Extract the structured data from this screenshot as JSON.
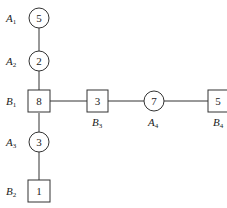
{
  "diagram": {
    "nodes": [
      {
        "id": "A1",
        "shape": "circle",
        "value": "5",
        "label": "A",
        "sub": "1"
      },
      {
        "id": "A2",
        "shape": "circle",
        "value": "2",
        "label": "A",
        "sub": "2"
      },
      {
        "id": "B1",
        "shape": "square",
        "value": "8",
        "label": "B",
        "sub": "1"
      },
      {
        "id": "A3",
        "shape": "circle",
        "value": "3",
        "label": "A",
        "sub": "3"
      },
      {
        "id": "B2",
        "shape": "square",
        "value": "1",
        "label": "B",
        "sub": "2"
      },
      {
        "id": "B3",
        "shape": "square",
        "value": "3",
        "label": "B",
        "sub": "3"
      },
      {
        "id": "A4",
        "shape": "circle",
        "value": "7",
        "label": "A",
        "sub": "4"
      },
      {
        "id": "B4",
        "shape": "square",
        "value": "5",
        "label": "B",
        "sub": "4"
      }
    ],
    "edges": [
      [
        "A1",
        "A2"
      ],
      [
        "A2",
        "B1"
      ],
      [
        "B1",
        "A3"
      ],
      [
        "A3",
        "B2"
      ],
      [
        "B1",
        "B3"
      ],
      [
        "B3",
        "A4"
      ],
      [
        "A4",
        "B4"
      ]
    ]
  }
}
